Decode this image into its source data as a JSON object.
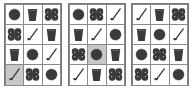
{
  "colors": {
    "icon": "#3a3a3a",
    "grid_line": "#8a8a8a",
    "highlight": "#c8c8c8",
    "background": "#ffffff"
  },
  "panels": [
    {
      "label": "panel-1",
      "left": 4,
      "cells": [
        [
          "ball",
          "cup",
          "pretzel"
        ],
        [
          "pretzel",
          "club",
          "cup"
        ],
        [
          "cup",
          "ball",
          "club"
        ],
        [
          "club",
          "pretzel",
          "ball"
        ]
      ],
      "highlight": [
        3,
        0
      ]
    },
    {
      "label": "panel-2",
      "left": 68,
      "cells": [
        [
          "ball",
          "pretzel",
          "club"
        ],
        [
          "cup",
          "club",
          "ball"
        ],
        [
          "pretzel",
          "ball",
          "cup"
        ],
        [
          "club",
          "cup",
          "pretzel"
        ]
      ],
      "highlight": [
        2,
        1
      ]
    },
    {
      "label": "panel-3",
      "left": 131,
      "cells": [
        [
          "club",
          "cup",
          "pretzel"
        ],
        [
          "cup",
          "ball",
          "club"
        ],
        [
          "ball",
          "pretzel",
          "cup"
        ],
        [
          "pretzel",
          "club",
          "ball"
        ]
      ],
      "highlight": null
    }
  ]
}
